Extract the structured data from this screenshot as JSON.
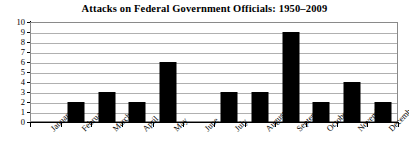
{
  "chart_data": {
    "type": "bar",
    "title": "Attacks on Federal Government Officials: 1950–2009",
    "xlabel": "",
    "ylabel": "",
    "categories": [
      "January",
      "February",
      "March",
      "April",
      "May",
      "June",
      "July",
      "August",
      "September",
      "October",
      "November",
      "December"
    ],
    "values": [
      0,
      2,
      3,
      2,
      6,
      0,
      3,
      3,
      9,
      2,
      4,
      2
    ],
    "ylim": [
      0,
      10
    ],
    "ytick_labels": [
      "0",
      "1",
      "2",
      "3",
      "4",
      "5",
      "6",
      "7",
      "8",
      "9",
      "10"
    ],
    "ytick_values": [
      0,
      1,
      2,
      3,
      4,
      5,
      6,
      7,
      8,
      9,
      10
    ],
    "grid": true,
    "legend": false,
    "bar_color": "#000000",
    "gridline_color": "#b0b0b0",
    "axis_color": "#000000",
    "plot_background": "#ffffff"
  }
}
